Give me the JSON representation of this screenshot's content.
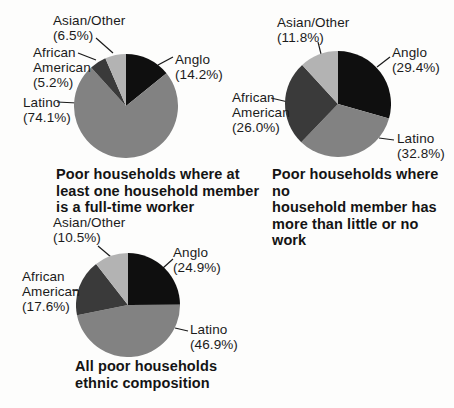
{
  "figure": {
    "background_color": "#fdfdfc",
    "text_color": "#1b1b1b",
    "leader_line_color": "#1a1a1a"
  },
  "palette": {
    "anglo": "#0f0f0f",
    "latino": "#828282",
    "african_american": "#3a3a3a",
    "asian_other": "#b3b3b3"
  },
  "chart_data": [
    {
      "type": "pie",
      "title": "Poor households where at least one household member is a full-time worker",
      "title_lines": [
        "Poor households where at",
        "least one household member",
        "is a full-time worker"
      ],
      "start_angle_deg": 0,
      "direction": "clockwise",
      "slices": [
        {
          "label": "Anglo",
          "value": 14.2,
          "pct_label": "(14.2%)",
          "color": "#0f0f0f"
        },
        {
          "label": "Latino",
          "value": 74.1,
          "pct_label": "(74.1%)",
          "color": "#828282"
        },
        {
          "label": "African American",
          "value": 5.2,
          "pct_label": "(5.2%)",
          "color": "#3a3a3a"
        },
        {
          "label": "Asian/Other",
          "value": 6.5,
          "pct_label": "(6.5%)",
          "color": "#b3b3b3"
        }
      ]
    },
    {
      "type": "pie",
      "title": "Poor households where no household member has more than little or no work",
      "title_lines": [
        "Poor households where no",
        "household member has",
        "more than little or no work"
      ],
      "start_angle_deg": 0,
      "direction": "clockwise",
      "slices": [
        {
          "label": "Anglo",
          "value": 29.4,
          "pct_label": "(29.4%)",
          "color": "#0f0f0f"
        },
        {
          "label": "Latino",
          "value": 32.8,
          "pct_label": "(32.8%)",
          "color": "#828282"
        },
        {
          "label": "African American",
          "value": 26.0,
          "pct_label": "(26.0%)",
          "color": "#3a3a3a"
        },
        {
          "label": "Asian/Other",
          "value": 11.8,
          "pct_label": "(11.8%)",
          "color": "#b3b3b3"
        }
      ]
    },
    {
      "type": "pie",
      "title": "All poor households ethnic composition",
      "title_lines": [
        "All poor households",
        "ethnic composition"
      ],
      "start_angle_deg": 0,
      "direction": "clockwise",
      "slices": [
        {
          "label": "Anglo",
          "value": 24.9,
          "pct_label": "(24.9%)",
          "color": "#0f0f0f"
        },
        {
          "label": "Latino",
          "value": 46.9,
          "pct_label": "(46.9%)",
          "color": "#828282"
        },
        {
          "label": "African American",
          "value": 17.6,
          "pct_label": "(17.6%)",
          "color": "#3a3a3a"
        },
        {
          "label": "Asian/Other",
          "value": 10.5,
          "pct_label": "(10.5%)",
          "color": "#b3b3b3"
        }
      ]
    }
  ]
}
